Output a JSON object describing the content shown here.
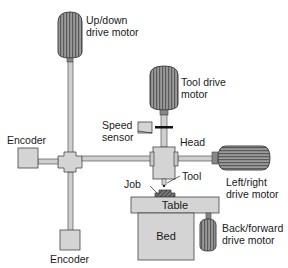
{
  "diagram": {
    "type": "cnc-machine-schematic",
    "labels": {
      "updown_motor": [
        "Up/down",
        "drive motor"
      ],
      "tool_motor": [
        "Tool drive",
        "motor"
      ],
      "speed_sensor": [
        "Speed",
        "sensor"
      ],
      "head": "Head",
      "encoder_left": "Encoder",
      "encoder_bottom": "Encoder",
      "leftright_motor": [
        "Left/right",
        "drive motor"
      ],
      "job": "Job",
      "tool": "Tool",
      "table": "Table",
      "bed": "Bed",
      "backforward_motor": [
        "Back/forward",
        "drive motor"
      ]
    },
    "colors": {
      "component_fill": "#d4d4d4",
      "component_stroke": "#444444",
      "motor_fill": "#8a8a8a",
      "motor_dark": "#555555",
      "shaft": "#cfcfcf",
      "job_fill": "#6e6e6e"
    }
  }
}
